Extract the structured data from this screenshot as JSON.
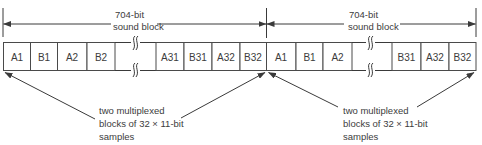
{
  "diagram": {
    "colors": {
      "line": "#3a3a3a",
      "text": "#3c3c3c",
      "background": "#ffffff"
    },
    "sound_blocks": [
      {
        "size_label_line1": "704-bit",
        "size_label_line2": "sound block",
        "cells": [
          "A1",
          "B1",
          "A2",
          "B2",
          "",
          "A31",
          "B31",
          "A32",
          "B32"
        ]
      },
      {
        "size_label_line1": "704-bit",
        "size_label_line2": "sound block",
        "cells": [
          "A1",
          "B1",
          "A2",
          "",
          "B31",
          "A32",
          "B32"
        ]
      }
    ],
    "annotations": [
      {
        "line1": "two multiplexed",
        "line2": "blocks of 32 × 11-bit",
        "line3": "samples"
      },
      {
        "line1": "two multiplexed",
        "line2": "blocks of 32 × 11-bit",
        "line3": "samples"
      }
    ],
    "break_symbol": "omitted-cells-break-icon"
  }
}
